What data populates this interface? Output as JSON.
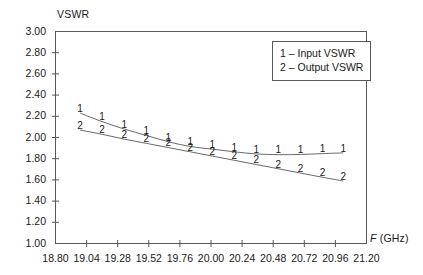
{
  "chart_data": {
    "type": "line",
    "title": "",
    "xlabel": "F (GHz)",
    "ylabel": "VSWR",
    "xlim": [
      18.8,
      21.2
    ],
    "ylim": [
      1.0,
      3.0
    ],
    "grid": false,
    "legend_position": "top-right",
    "marker_style": "series-number-digit",
    "xticks": [
      "18.80",
      "19.04",
      "19.28",
      "19.52",
      "19.76",
      "20.00",
      "20.24",
      "20.48",
      "20.72",
      "20.96",
      "21.20"
    ],
    "xtick_values": [
      18.8,
      19.04,
      19.28,
      19.52,
      19.76,
      20.0,
      20.24,
      20.48,
      20.72,
      20.96,
      21.2
    ],
    "yticks": [
      "1.00",
      "1.20",
      "1.40",
      "1.60",
      "1.80",
      "2.00",
      "2.20",
      "2.40",
      "2.60",
      "2.80",
      "3.00"
    ],
    "ytick_values": [
      1.0,
      1.2,
      1.4,
      1.6,
      1.8,
      2.0,
      2.2,
      2.4,
      2.6,
      2.8,
      3.0
    ],
    "legend": [
      "1 – Input VSWR",
      "2 – Output VSWR"
    ],
    "series": [
      {
        "name": "Input VSWR",
        "marker_label": "1",
        "x": [
          18.99,
          19.16,
          19.33,
          19.5,
          19.67,
          19.84,
          20.01,
          20.18,
          20.35,
          20.52,
          20.69,
          20.86,
          21.02
        ],
        "values": [
          2.23,
          2.15,
          2.08,
          2.02,
          1.96,
          1.915,
          1.89,
          1.865,
          1.845,
          1.838,
          1.84,
          1.848,
          1.855
        ]
      },
      {
        "name": "Output VSWR",
        "marker_label": "2",
        "x": [
          18.99,
          19.16,
          19.33,
          19.5,
          19.67,
          19.84,
          20.01,
          20.18,
          20.35,
          20.52,
          20.69,
          20.86,
          21.02
        ],
        "values": [
          2.07,
          2.03,
          1.985,
          1.945,
          1.905,
          1.865,
          1.825,
          1.785,
          1.745,
          1.705,
          1.665,
          1.625,
          1.59
        ]
      }
    ]
  }
}
